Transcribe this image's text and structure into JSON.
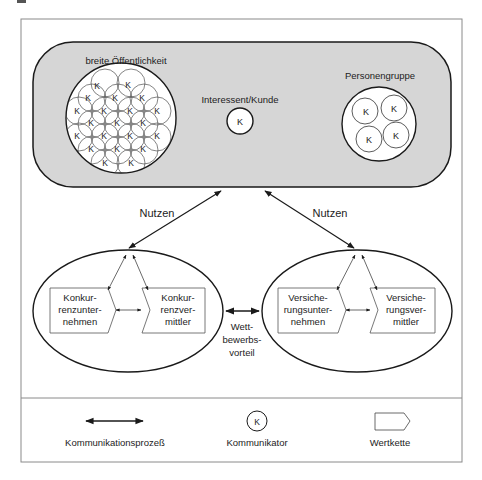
{
  "diagram": {
    "top_area": {
      "groups": [
        {
          "label": "breite Öffentlichkeit",
          "symbol": "K",
          "count": 19
        },
        {
          "label": "Interessent/Kunde",
          "symbol": "K",
          "count": 1
        },
        {
          "label": "Personengruppe",
          "symbol": "K",
          "count": 4
        }
      ]
    },
    "arrows": {
      "left_label": "Nutzen",
      "right_label": "Nutzen",
      "middle_label": "Wett-\nbewerbs-\nvorteil",
      "middle_label_lines": [
        "Wett-",
        "bewerbs-",
        "vorteil"
      ]
    },
    "left_ellipse": {
      "boxes": [
        {
          "lines": [
            "Konkur-",
            "renzunter-",
            "nehmen"
          ]
        },
        {
          "lines": [
            "Konkur-",
            "renzver-",
            "mittler"
          ]
        }
      ]
    },
    "right_ellipse": {
      "boxes": [
        {
          "lines": [
            "Versiche-",
            "rungsunter-",
            "nehmen"
          ]
        },
        {
          "lines": [
            "Versiche-",
            "rungsver-",
            "mittler"
          ]
        }
      ]
    },
    "legend": {
      "items": [
        {
          "icon": "double-arrow-icon",
          "label": "Kommunikationsprozeß"
        },
        {
          "icon": "communicator-k-icon",
          "label": "Kommunikator",
          "symbol": "K"
        },
        {
          "icon": "value-chain-pentagon-icon",
          "label": "Wertkette"
        }
      ]
    },
    "colors": {
      "top_fill": "#d6d6d6",
      "frame": "#8a8a8a",
      "stroke": "#1a1a1a"
    }
  }
}
